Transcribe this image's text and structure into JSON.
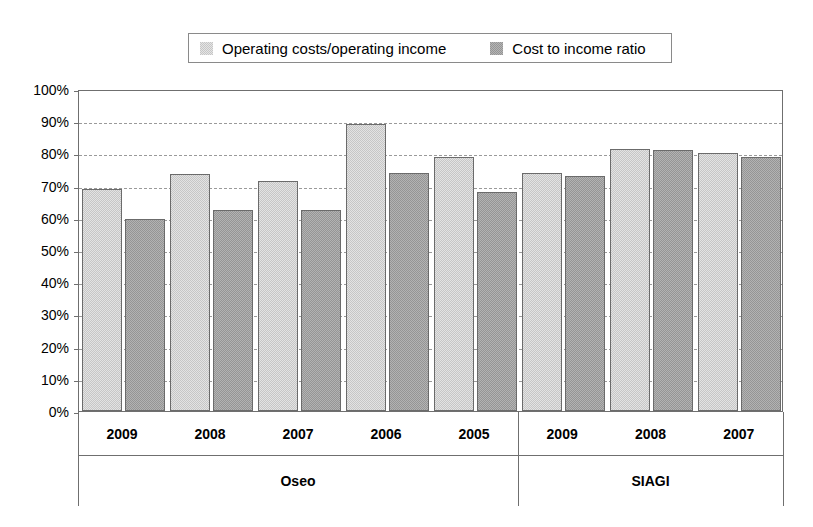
{
  "chart_data": {
    "type": "bar",
    "title": "",
    "xlabel": "",
    "ylabel": "",
    "ylim": [
      0,
      100
    ],
    "y_unit": "%",
    "grid": true,
    "legend_position": "top",
    "y_ticks": [
      "0%",
      "10%",
      "20%",
      "30%",
      "40%",
      "50%",
      "60%",
      "70%",
      "80%",
      "90%",
      "100%"
    ],
    "y_tick_values": [
      0,
      10,
      20,
      30,
      40,
      50,
      60,
      70,
      80,
      90,
      100
    ],
    "legend": [
      {
        "label": "Operating costs/operating income",
        "color": "#c6c6c6",
        "swatch": "light-gray-swatch"
      },
      {
        "label": "Cost to income ratio",
        "color": "#959595",
        "swatch": "dark-gray-swatch"
      }
    ],
    "series": [
      {
        "name": "Operating costs/operating income",
        "color": "#c6c6c6",
        "values": [
          69,
          73.5,
          71.5,
          89,
          79,
          74,
          81.5,
          80
        ]
      },
      {
        "name": "Cost to income ratio",
        "color": "#959595",
        "values": [
          59.5,
          62.5,
          62.5,
          74,
          68,
          73,
          81,
          79
        ]
      }
    ],
    "categories": [
      "2009",
      "2008",
      "2007",
      "2006",
      "2005",
      "2009",
      "2008",
      "2007"
    ],
    "groups": [
      {
        "label": "Oseo",
        "categories": [
          "2009",
          "2008",
          "2007",
          "2006",
          "2005"
        ]
      },
      {
        "label": "SIAGI",
        "categories": [
          "2009",
          "2008",
          "2007"
        ]
      }
    ]
  }
}
